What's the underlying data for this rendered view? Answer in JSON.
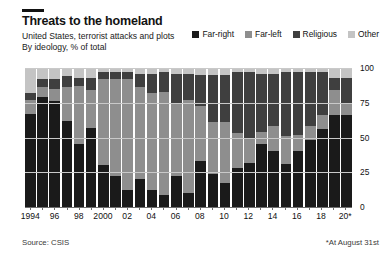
{
  "header": {
    "title": "Threats to the homeland",
    "subtitle": "United States, terrorist attacks and plots",
    "subtitle2": "By ideology, % of total"
  },
  "footer": {
    "source": "Source: CSIS",
    "footnote": "*At August 31st"
  },
  "colors": {
    "far_right": "#1a1a1a",
    "far_left": "#8e8e8e",
    "religious": "#3f3f3f",
    "other": "#c4c4c4",
    "gridline": "#c9c9c9",
    "axis": "#6e6e6e",
    "text": "#121212",
    "background": "#ffffff"
  },
  "chart_data": {
    "type": "bar",
    "subtype": "stacked-100",
    "title": "Threats to the homeland",
    "subtitle": "United States, terrorist attacks and plots",
    "xlabel": "",
    "ylabel": "% of total",
    "ylim": [
      0,
      100
    ],
    "yticks": [
      0,
      25,
      50,
      75,
      100
    ],
    "ytick_labels": [
      "0",
      "25",
      "50",
      "75",
      "100"
    ],
    "grid": true,
    "legend_position": "top-right",
    "categories": [
      "1994",
      "1995",
      "1996",
      "1997",
      "1998",
      "1999",
      "2000",
      "2001",
      "2002",
      "2003",
      "2004",
      "2005",
      "2006",
      "2007",
      "2008",
      "2009",
      "2010",
      "2011",
      "2012",
      "2013",
      "2014",
      "2015",
      "2016",
      "2017",
      "2018",
      "2019",
      "2020*"
    ],
    "xtick_labels": [
      "1994",
      "",
      "96",
      "",
      "98",
      "",
      "2000",
      "",
      "02",
      "",
      "04",
      "",
      "06",
      "",
      "08",
      "",
      "10",
      "",
      "12",
      "",
      "14",
      "",
      "16",
      "",
      "18",
      "",
      "20*"
    ],
    "series": [
      {
        "name": "Far-right",
        "color": "#1a1a1a",
        "values": [
          67,
          79,
          76,
          62,
          45,
          57,
          30,
          22,
          12,
          20,
          12,
          9,
          22,
          10,
          33,
          24,
          17,
          28,
          32,
          45,
          40,
          31,
          40,
          48,
          56,
          66,
          66
        ]
      },
      {
        "name": "Far-left",
        "color": "#8e8e8e",
        "values": [
          10,
          7,
          9,
          24,
          42,
          27,
          62,
          70,
          80,
          66,
          70,
          74,
          53,
          67,
          40,
          37,
          44,
          25,
          18,
          9,
          18,
          20,
          12,
          10,
          10,
          18,
          9
        ]
      },
      {
        "name": "Religious",
        "color": "#3f3f3f",
        "values": [
          5,
          6,
          7,
          8,
          6,
          9,
          5,
          5,
          5,
          10,
          14,
          14,
          21,
          19,
          22,
          34,
          34,
          44,
          47,
          42,
          38,
          46,
          45,
          39,
          31,
          9,
          18
        ]
      },
      {
        "name": "Other",
        "color": "#c4c4c4",
        "values": [
          18,
          8,
          8,
          6,
          7,
          7,
          3,
          3,
          3,
          4,
          4,
          3,
          4,
          4,
          5,
          5,
          5,
          3,
          3,
          4,
          4,
          3,
          3,
          3,
          3,
          7,
          7
        ]
      }
    ]
  }
}
